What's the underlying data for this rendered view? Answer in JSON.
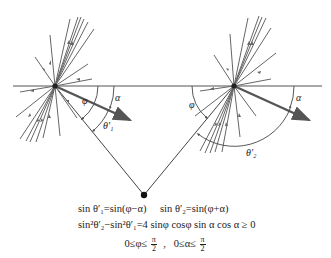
{
  "diagram": {
    "type": "optics / scattering geometry",
    "left_point": {
      "x": 55,
      "y": 86
    },
    "right_point": {
      "x": 234,
      "y": 86
    },
    "bottom_vertex": {
      "x": 144,
      "y": 195
    },
    "surface_line": {
      "x1": 13,
      "x2": 322,
      "y": 86
    },
    "labels": {
      "phi": "φ",
      "alpha": "α",
      "theta1": "θ′₁",
      "theta2": "θ′₂"
    },
    "colors": {
      "line": "#555555",
      "dark": "#222222"
    }
  },
  "equations": {
    "line1_left": "sin θ′₁=sin(φ−α)",
    "line1_right": "sin θ′₂=sin(φ+α)",
    "line2": "sin²θ′₂−sin²θ′₁=4 sinφ cosφ sin α cos α ≥ 0",
    "line3_a": "0≤φ≤",
    "line3_sep": " ,  ",
    "line3_b": "0≤α≤",
    "frac_num": "π",
    "frac_den": "2"
  }
}
